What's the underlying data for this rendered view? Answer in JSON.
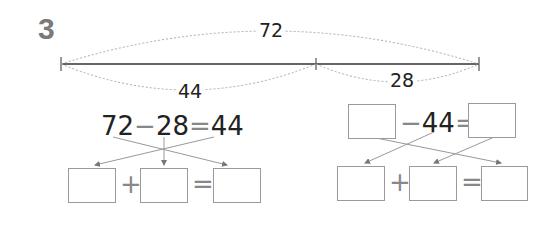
{
  "problem_number": "3",
  "segment_diagram": {
    "total_label": "72",
    "left_part_label": "44",
    "right_part_label": "28"
  },
  "left_equation": {
    "a": "72",
    "op1": "−",
    "b": "28",
    "op2": "=",
    "c": "44",
    "answer_row": {
      "op1": "+",
      "op2": "=",
      "boxes": [
        "",
        "",
        ""
      ]
    }
  },
  "right_equation": {
    "box1": "",
    "op1": "−",
    "b": "44",
    "op2": "=",
    "box2": "",
    "answer_row": {
      "op1": "+",
      "op2": "=",
      "boxes": [
        "",
        "",
        ""
      ]
    }
  },
  "colors": {
    "text": "#222222",
    "muted": "#888888",
    "box_border": "#9a9a9a",
    "number": "#7a7a7a"
  }
}
